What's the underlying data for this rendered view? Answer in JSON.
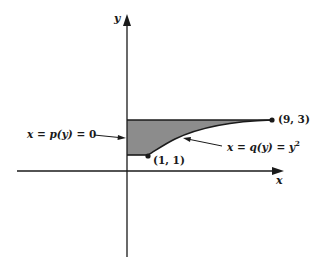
{
  "figure": {
    "axes": {
      "x_label": "x",
      "y_label": "y"
    },
    "points": [
      {
        "label": "(1, 1)",
        "x": 1,
        "y": 1
      },
      {
        "label": "(9, 3)",
        "x": 9,
        "y": 3
      }
    ],
    "annotations": {
      "left_boundary": {
        "lhs": "x",
        "eq1": " = ",
        "func": "p(y)",
        "eq2": " = ",
        "rhs": "0"
      },
      "right_boundary": {
        "lhs": "x",
        "eq1": " = ",
        "func": "q(y)",
        "eq2": " = ",
        "rhs_base": "y",
        "rhs_exp": "2"
      }
    },
    "region": {
      "description": "Shaded region between x = 0 and x = y^2 for 1 ≤ y ≤ 3",
      "fill_color": "#8c8c8c",
      "y_min": 1,
      "y_max": 3
    },
    "colors": {
      "stroke": "#1a1a1a",
      "fill": "#8c8c8c",
      "background": "#ffffff"
    }
  }
}
